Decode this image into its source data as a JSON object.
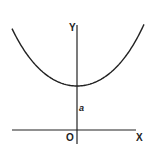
{
  "diagram": {
    "type": "function-plot",
    "colors": {
      "background": "#ffffff",
      "ink": "#222222"
    },
    "axes": {
      "x_label": "X",
      "y_label": "Y",
      "origin_label": "O"
    },
    "annotations": {
      "intercept_label": "a"
    },
    "curve": {
      "shape": "catenary",
      "min_point_on_y_axis": true,
      "symmetric_about_y_axis": true
    }
  }
}
